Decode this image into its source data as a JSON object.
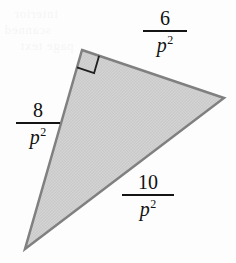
{
  "figure": {
    "shape": "right-triangle",
    "fill_color": "#d2d2d2",
    "stroke_color": "#808080",
    "stroke_width": 2.5,
    "background_color": "#fdfdfd",
    "vertices": {
      "right_angle": [
        82,
        50
      ],
      "right": [
        224,
        98
      ],
      "bottom_left": [
        25,
        249
      ]
    },
    "right_angle_marker": {
      "present": true,
      "at_vertex": "right_angle",
      "size": 18
    }
  },
  "labels": {
    "top": {
      "numerator": "6",
      "denominator_base": "p",
      "denominator_exponent": "2",
      "full": "6/p^2",
      "side": "top-edge"
    },
    "left": {
      "numerator": "8",
      "denominator_base": "p",
      "denominator_exponent": "2",
      "full": "8/p^2",
      "side": "left-edge"
    },
    "bottom": {
      "numerator": "10",
      "denominator_base": "p",
      "denominator_exponent": "2",
      "full": "10/p^2",
      "side": "bottom-edge-hypotenuse"
    }
  },
  "background_ghosting": {
    "line1": "interior",
    "line2": "scanned",
    "line3": "page text",
    "line4": "faint"
  }
}
